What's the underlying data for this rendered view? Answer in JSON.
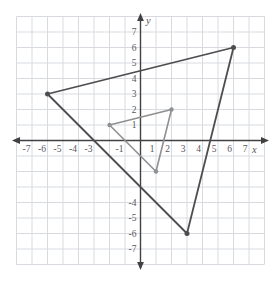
{
  "figure": {
    "width": 279,
    "height": 282,
    "background": "#ffffff",
    "grid_color": "#d7dbe0",
    "axis_color": "#414144",
    "tick_text_color": "#57575a",
    "axis_letter_x": "x",
    "axis_letter_y": "y"
  },
  "chart_data": {
    "type": "scatter",
    "title": "",
    "xlabel": "x",
    "ylabel": "y",
    "xlim": [
      -8,
      8
    ],
    "ylim": [
      -8,
      8
    ],
    "grid": true,
    "x_tick_labels": [
      "-7",
      "-6",
      "-5",
      "-4",
      "-3",
      "-1",
      "1",
      "2",
      "3",
      "4",
      "5",
      "6",
      "7"
    ],
    "y_tick_labels": [
      "7",
      "6",
      "5",
      "4",
      "3",
      "2",
      "1",
      "-4",
      "-5",
      "-6",
      "-7"
    ],
    "series": [
      {
        "name": "large-triangle",
        "shape": "closed-polygon",
        "color": "#4d4d4f",
        "stroke_width": 1.8,
        "dot_radius": 2.5,
        "points": [
          [
            -6,
            3
          ],
          [
            6,
            6
          ],
          [
            3,
            -6
          ]
        ]
      },
      {
        "name": "small-triangle",
        "shape": "closed-polygon",
        "color": "#8f9092",
        "stroke_width": 1.6,
        "dot_radius": 2.2,
        "points": [
          [
            -2,
            1
          ],
          [
            2,
            2
          ],
          [
            1,
            -2
          ]
        ]
      }
    ],
    "annotations": "Small triangle dilated by factor 3 about origin gives large triangle"
  }
}
